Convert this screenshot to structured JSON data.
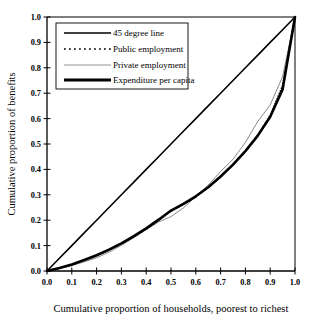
{
  "chart_data": {
    "type": "line",
    "title": "",
    "xlabel": "Cumulative proportion of households, poorest to richest",
    "ylabel": "Cumulative proportion of benefits",
    "xlim": [
      0.0,
      1.0
    ],
    "ylim": [
      0.0,
      1.0
    ],
    "grid": false,
    "legend_position": "top-left",
    "xticks": [
      "0.0",
      "0.1",
      "0.2",
      "0.3",
      "0.4",
      "0.5",
      "0.6",
      "0.7",
      "0.8",
      "0.9",
      "1.0"
    ],
    "yticks": [
      "0.0",
      "0.1",
      "0.2",
      "0.3",
      "0.4",
      "0.5",
      "0.6",
      "0.7",
      "0.8",
      "0.9",
      "1.0"
    ],
    "x": [
      0.0,
      0.05,
      0.1,
      0.15,
      0.2,
      0.25,
      0.3,
      0.35,
      0.4,
      0.45,
      0.5,
      0.55,
      0.6,
      0.65,
      0.7,
      0.75,
      0.8,
      0.85,
      0.9,
      0.95,
      1.0
    ],
    "series": [
      {
        "name": "45 degree line",
        "style": "solid",
        "width": 1.6,
        "color": "#000000",
        "values": [
          0.0,
          0.05,
          0.1,
          0.15,
          0.2,
          0.25,
          0.3,
          0.35,
          0.4,
          0.45,
          0.5,
          0.55,
          0.6,
          0.65,
          0.7,
          0.75,
          0.8,
          0.85,
          0.9,
          0.95,
          1.0
        ]
      },
      {
        "name": "Public employment",
        "style": "dotted",
        "width": 1.7,
        "color": "#000000",
        "values": [
          0.0,
          0.011,
          0.025,
          0.041,
          0.06,
          0.082,
          0.107,
          0.134,
          0.165,
          0.199,
          0.236,
          0.262,
          0.292,
          0.329,
          0.371,
          0.418,
          0.472,
          0.535,
          0.612,
          0.73,
          1.0
        ]
      },
      {
        "name": "Private employment",
        "style": "solid",
        "width": 0.7,
        "color": "#555555",
        "values": [
          0.0,
          0.009,
          0.021,
          0.036,
          0.052,
          0.074,
          0.101,
          0.131,
          0.163,
          0.193,
          0.214,
          0.248,
          0.293,
          0.338,
          0.392,
          0.44,
          0.506,
          0.589,
          0.654,
          0.765,
          1.0
        ]
      },
      {
        "name": "Expenditure per capita",
        "style": "solid",
        "width": 2.6,
        "color": "#000000",
        "values": [
          0.0,
          0.012,
          0.026,
          0.043,
          0.062,
          0.084,
          0.109,
          0.137,
          0.168,
          0.202,
          0.238,
          0.264,
          0.294,
          0.33,
          0.372,
          0.419,
          0.472,
          0.533,
          0.607,
          0.715,
          1.0
        ]
      }
    ]
  },
  "legend": {
    "items": [
      {
        "label": "45 degree line"
      },
      {
        "label": "Public employment"
      },
      {
        "label": "Private employment"
      },
      {
        "label": "Expenditure per capita"
      }
    ]
  }
}
